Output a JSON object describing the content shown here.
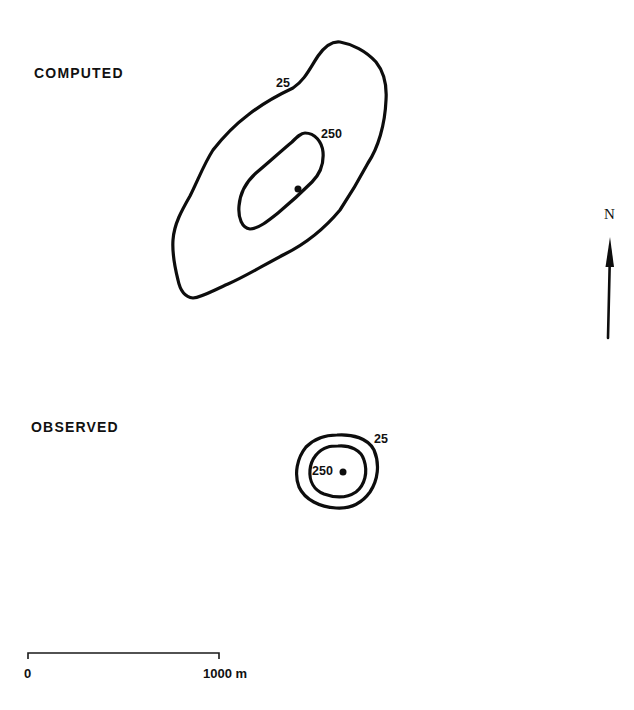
{
  "panels": {
    "computed": {
      "title": "COMPUTED",
      "title_pos": {
        "x": 34,
        "y": 66
      },
      "contours": [
        {
          "level": "25",
          "label_pos": {
            "x": 276,
            "y": 77
          },
          "path": "M 293 88 C 305 80, 310 68, 318 56 C 325 46, 332 41, 340 42 C 352 44, 366 51, 376 62 C 384 72, 387 85, 386 100 C 385 125, 378 148, 368 163 C 360 178, 352 192, 340 210 C 325 228, 305 244, 285 254 C 262 266, 246 276, 228 284 C 212 291, 202 297, 193 298 C 184 297, 180 290, 178 280 C 175 268, 172 254, 173 240 C 174 224, 182 210, 190 196 C 198 180, 204 164, 213 150 C 224 136, 236 124, 248 115 C 262 104, 276 96, 293 88 Z"
        },
        {
          "level": "250",
          "label_pos": {
            "x": 321,
            "y": 128
          },
          "path": "M 305 133 C 315 133, 322 142, 323 152 C 324 164, 320 174, 312 182 C 302 192, 290 203, 278 213 C 268 221, 258 229, 250 229 C 242 228, 238 218, 239 206 C 240 193, 246 182, 256 173 C 268 163, 280 152, 292 142 C 297 137, 301 133, 305 133 Z"
        }
      ],
      "source": {
        "x": 298,
        "y": 189,
        "r": 3.5
      }
    },
    "observed": {
      "title": "OBSERVED",
      "title_pos": {
        "x": 31,
        "y": 420
      },
      "contours": [
        {
          "level": "25",
          "label_pos": {
            "x": 374,
            "y": 433
          },
          "path": "M 337 435 C 352 434, 368 438, 374 450 C 380 464, 378 480, 370 492 C 362 503, 350 509, 336 508 C 320 507, 305 500, 299 487 C 294 474, 297 458, 306 447 C 314 439, 325 435, 337 435 Z"
        },
        {
          "level": "250",
          "label_pos": {
            "x": 312,
            "y": 465
          },
          "path": "M 338 446 C 350 445, 361 450, 364 460 C 368 472, 365 485, 356 492 C 347 498, 335 498, 324 494 C 314 490, 309 481, 310 470 C 311 459, 318 450, 328 447 C 331 446, 335 446, 338 446 Z"
        }
      ],
      "source": {
        "x": 343,
        "y": 472,
        "r": 3.5
      }
    }
  },
  "north_arrow": {
    "label": "N",
    "label_pos": {
      "x": 604,
      "y": 207
    },
    "tip": {
      "x": 610,
      "y": 237
    },
    "tail": {
      "x": 608,
      "y": 338
    }
  },
  "scale_bar": {
    "start_label": "0",
    "end_label": "1000 m",
    "x_start": 28,
    "x_end": 219,
    "y": 653,
    "tick_height": 6,
    "start_label_pos": {
      "x": 24,
      "y": 667
    },
    "end_label_pos": {
      "x": 203,
      "y": 667
    }
  }
}
